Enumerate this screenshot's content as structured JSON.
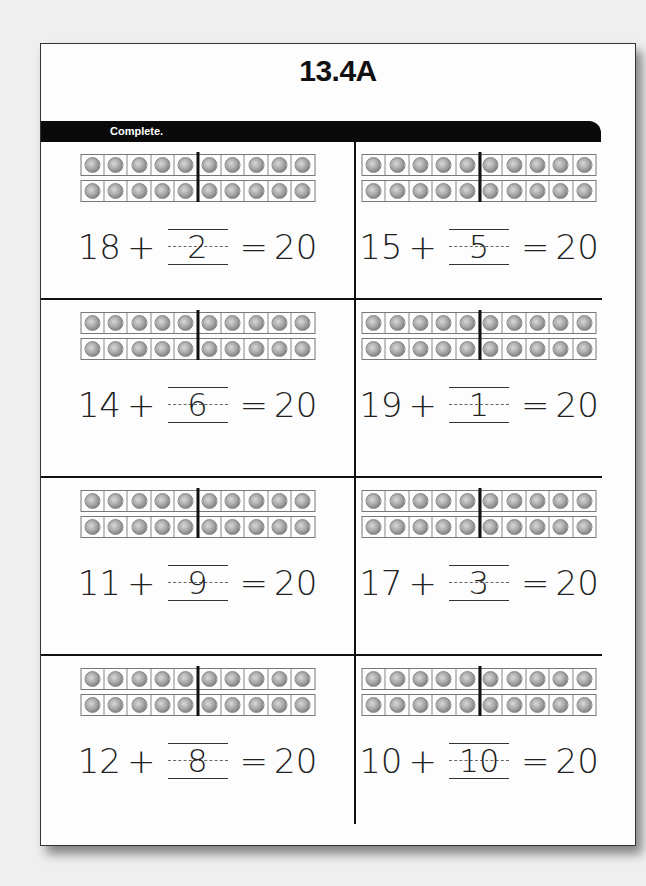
{
  "worksheet": {
    "title": "13.4A",
    "instruction": "Complete.",
    "problems": [
      {
        "addend": "18",
        "plus": "+",
        "answer": "2",
        "equals": "=",
        "sum": "20"
      },
      {
        "addend": "15",
        "plus": "+",
        "answer": "5",
        "equals": "=",
        "sum": "20"
      },
      {
        "addend": "14",
        "plus": "+",
        "answer": "6",
        "equals": "=",
        "sum": "20"
      },
      {
        "addend": "19",
        "plus": "+",
        "answer": "1",
        "equals": "=",
        "sum": "20"
      },
      {
        "addend": "11",
        "plus": "+",
        "answer": "9",
        "equals": "=",
        "sum": "20"
      },
      {
        "addend": "17",
        "plus": "+",
        "answer": "3",
        "equals": "=",
        "sum": "20"
      },
      {
        "addend": "12",
        "plus": "+",
        "answer": "8",
        "equals": "=",
        "sum": "20"
      },
      {
        "addend": "10",
        "plus": "+",
        "answer": "10",
        "equals": "=",
        "sum": "20"
      }
    ],
    "ten_frame": {
      "rows": 2,
      "slots_per_row": 10,
      "counters": 20,
      "counter_icon": "coin-icon"
    }
  }
}
